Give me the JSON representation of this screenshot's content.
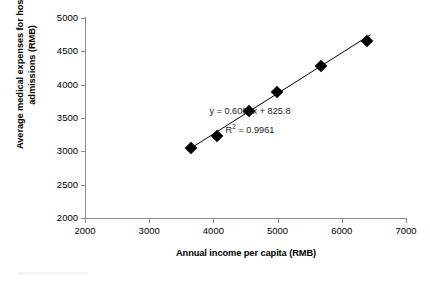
{
  "chart_data": {
    "type": "scatter",
    "title": "",
    "xlabel": "Annual income per capita (RMB)",
    "ylabel": "Average medical expenses for hospital admissions (RMB)",
    "xlim": [
      2000,
      7000
    ],
    "ylim": [
      2000,
      5000
    ],
    "xticks": [
      2000,
      3000,
      4000,
      5000,
      6000,
      7000
    ],
    "yticks": [
      2000,
      2500,
      3000,
      3500,
      4000,
      4500,
      5000
    ],
    "grid": false,
    "legend": null,
    "series": [
      {
        "name": "Hospital admission expenses vs income",
        "marker": "diamond",
        "color": "#000000",
        "points": [
          {
            "x": 3650,
            "y": 3050
          },
          {
            "x": 4060,
            "y": 3225
          },
          {
            "x": 4560,
            "y": 3605
          },
          {
            "x": 4990,
            "y": 3885
          },
          {
            "x": 5680,
            "y": 4280
          },
          {
            "x": 6390,
            "y": 4650
          }
        ]
      }
    ],
    "trendline": {
      "type": "linear",
      "slope": 0.6086,
      "intercept": 825.8,
      "r_squared": 0.9961,
      "equation_label": "y = 0.6086x + 825.8",
      "r2_label_prefix": "R",
      "r2_label_sup": "2",
      "r2_label_value": " = 0.9961"
    },
    "annotations": [
      "y = 0.6086x + 825.8",
      "R2 = 0.9961"
    ]
  }
}
